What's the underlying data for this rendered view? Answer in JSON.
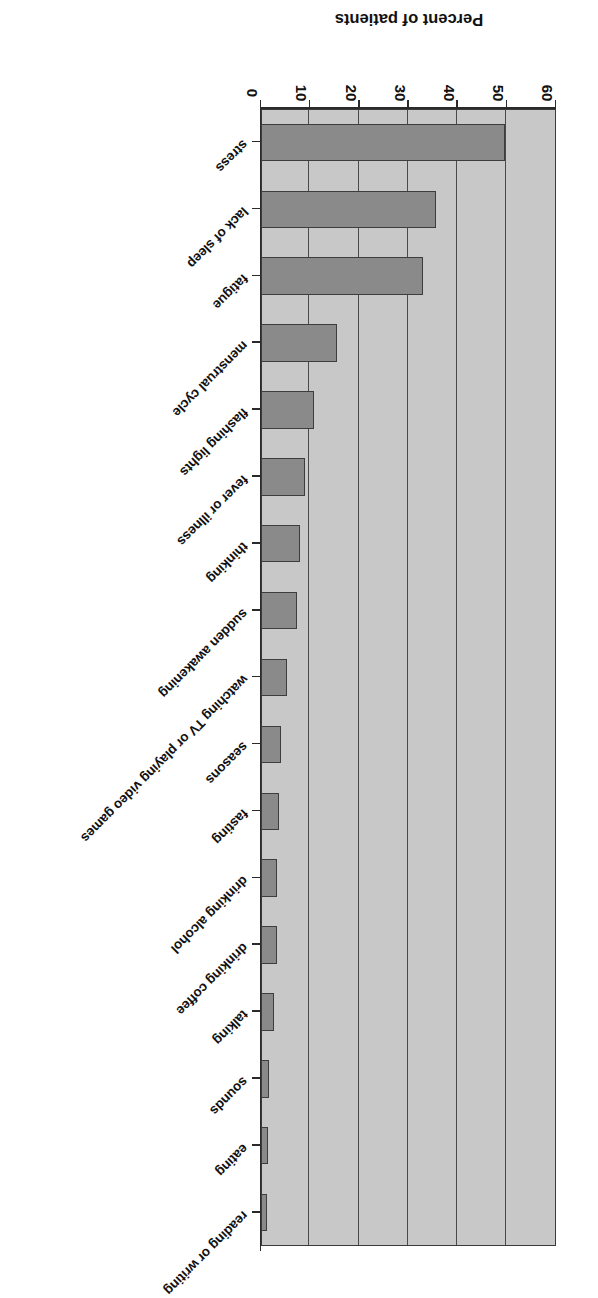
{
  "chart_data": {
    "type": "bar",
    "orientation": "horizontal",
    "title": "",
    "xlabel": "",
    "ylabel": "Percent of patients",
    "value_axis_title": "Percent of patients",
    "ylim": [
      0,
      60
    ],
    "xlim": [
      0,
      60
    ],
    "ticks": [
      "0",
      "10",
      "20",
      "30",
      "40",
      "50",
      "60"
    ],
    "tick_values": [
      0,
      10,
      20,
      30,
      40,
      50,
      60
    ],
    "grid": true,
    "legend": "none",
    "rotated_180": true,
    "bar_color": "#8a8a8a",
    "plot_background": "#c8c8c8",
    "axis_color": "#2a2a2a",
    "categories": [
      "stress",
      "lack of sleep",
      "fatigue",
      "menstrual cycle",
      "flashing lights",
      "fever or illness",
      "thinking",
      "sudden awakening",
      "watching TV or playing video games",
      "seasons",
      "fasting",
      "drinking alcohol",
      "drinking coffee",
      "talking",
      "sounds",
      "eating",
      "reading or writing"
    ],
    "values": [
      49.5,
      35.6,
      32.9,
      15.4,
      10.7,
      8.9,
      7.8,
      7.3,
      5.2,
      4.1,
      3.7,
      3.2,
      3.1,
      2.5,
      1.6,
      1.4,
      1.2
    ]
  }
}
